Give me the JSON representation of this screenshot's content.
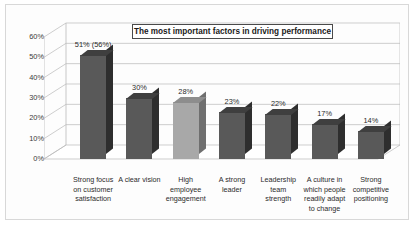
{
  "chart_data": {
    "type": "bar",
    "title": "The most important factors in driving performance",
    "xlabel": "",
    "ylabel": "",
    "ylim": [
      0,
      60
    ],
    "ytick_labels": [
      "60%",
      "50%",
      "40%",
      "30%",
      "20%",
      "10%",
      "0%"
    ],
    "ytick_values": [
      60,
      50,
      40,
      30,
      20,
      10,
      0
    ],
    "grid": true,
    "legend": "none",
    "style": "3d-column",
    "categories": [
      "Strong focus on customer satisfaction",
      "A clear vision",
      "High employee engagement",
      "A strong leader",
      "Leadership team strength",
      "A culture in which people readily adapt to change",
      "Strong competitive positioning"
    ],
    "category_lines": [
      [
        "Strong focus",
        "on customer",
        "satisfaction"
      ],
      [
        "A clear vision"
      ],
      [
        "High",
        "employee",
        "engagement"
      ],
      [
        "A strong",
        "leader"
      ],
      [
        "Leadership",
        "team",
        "strength"
      ],
      [
        "A culture in",
        "which people",
        "readily adapt",
        "to change"
      ],
      [
        "Strong",
        "competitive",
        "positioning"
      ]
    ],
    "values": [
      51,
      30,
      28,
      23,
      22,
      17,
      14
    ],
    "data_labels": [
      "51% (56%)",
      "30%",
      "28%",
      "23%",
      "22%",
      "17%",
      "14%"
    ],
    "bar_shades": [
      "dark",
      "dark",
      "light",
      "dark",
      "dark",
      "dark",
      "dark"
    ]
  },
  "colors": {
    "bar_dark_front": "#595959",
    "bar_dark_side": "#2e2e2e",
    "bar_light_front": "#a8a8a8",
    "frame_border": "#d8d8d8",
    "gridline": "#b9b9b9",
    "title_border": "#4a4a4a",
    "plot_background": "#ffffff"
  }
}
